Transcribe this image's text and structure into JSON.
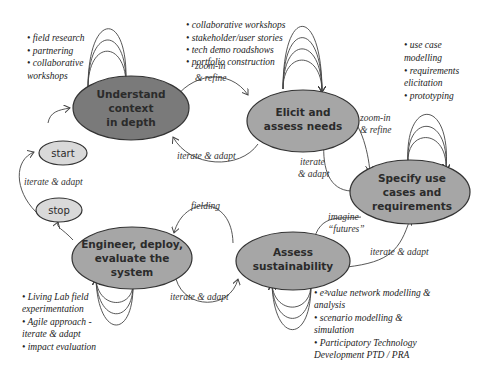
{
  "diagram": {
    "colors": {
      "dark_node": "#7a7a7a",
      "node": "#a6a6a6",
      "small_node": "#d9d9d9",
      "stroke": "#333333"
    },
    "nodes": {
      "understand": {
        "line1": "Understand",
        "line2": "context",
        "line3": "in depth"
      },
      "elicit": {
        "line1": "Elicit and",
        "line2": "assess needs"
      },
      "specify": {
        "line1": "Specify use",
        "line2": "cases and",
        "line3": "requirements"
      },
      "assess": {
        "line1": "Assess",
        "line2": "sustainability"
      },
      "engineer": {
        "line1": "Engineer, deploy,",
        "line2": "evaluate the",
        "line3": "system"
      },
      "start": {
        "label": "start"
      },
      "stop": {
        "label": "stop"
      }
    },
    "edges": {
      "understand_to_elicit": {
        "line1": "zoom-in",
        "line2": "& refine"
      },
      "elicit_to_understand": {
        "label": "iterate & adapt"
      },
      "elicit_to_specify": {
        "line1": "zoom-in",
        "line2": "& refine"
      },
      "specify_to_elicit": {
        "line1": "iterate",
        "line2": "& adapt"
      },
      "specify_to_assess": {
        "line1": "imagine",
        "line2": "“futures”"
      },
      "assess_to_specify": {
        "label": "iterate & adapt"
      },
      "assess_to_engineer": {
        "label": "fielding"
      },
      "engineer_to_assess": {
        "label": "iterate & adapt"
      },
      "stop_to_start": {
        "label": "iterate & adapt"
      }
    },
    "annotations": {
      "understand": [
        "• field research",
        "• partnering",
        "• collaborative",
        "workshops"
      ],
      "elicit": [
        "• collaborative workshops",
        "• stakeholder/user stories",
        "• tech demo roadshows",
        "• portfolio construction"
      ],
      "specify": [
        "• use case",
        "modelling",
        "• requirements",
        "elicitation",
        "• prototyping"
      ],
      "engineer": [
        "• Living Lab field",
        "experimentation",
        "• Agile approach -",
        "iterate & adapt",
        "• impact evaluation"
      ],
      "assess": [
        "• e³value network modelling &",
        "analysis",
        "• scenario modelling &",
        "simulation",
        "• Participatory Technology",
        "Development  PTD / PRA"
      ]
    }
  }
}
